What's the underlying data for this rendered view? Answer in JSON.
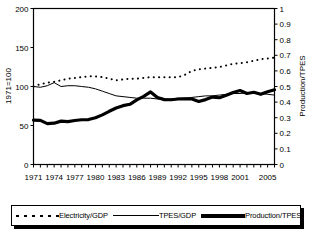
{
  "chart_data": {
    "type": "line",
    "title": "",
    "xlabel": "",
    "ylabel": "1971=100",
    "y2label": "Production/TPES",
    "grid": false,
    "legend_position": "bottom",
    "xlim": [
      1971,
      2006
    ],
    "ylim": [
      0,
      200
    ],
    "y2lim": [
      0,
      1
    ],
    "yticks": [
      0,
      50,
      100,
      150,
      200
    ],
    "ytick_labels": [
      "0",
      "50",
      "100",
      "150",
      "200"
    ],
    "y2ticks": [
      0,
      0.1,
      0.2,
      0.3,
      0.4,
      0.5,
      0.6,
      0.7,
      0.8,
      0.9,
      1
    ],
    "y2tick_labels": [
      "0",
      "0.1",
      "0.2",
      "0.3",
      "0.4",
      "0.5",
      "0.6",
      "0.7",
      "0.8",
      "0.9",
      "1"
    ],
    "xticks": [
      1971,
      1974,
      1977,
      1980,
      1983,
      1986,
      1989,
      1992,
      1995,
      1998,
      2001,
      2005
    ],
    "xtick_labels": [
      "1971",
      "1974",
      "1977",
      "1980",
      "1983",
      "1986",
      "1989",
      "1992",
      "1995",
      "1998",
      "2001",
      "2005"
    ],
    "x": [
      1971,
      1972,
      1973,
      1974,
      1975,
      1976,
      1977,
      1978,
      1979,
      1980,
      1981,
      1982,
      1983,
      1984,
      1985,
      1986,
      1987,
      1988,
      1989,
      1990,
      1991,
      1992,
      1993,
      1994,
      1995,
      1996,
      1997,
      1998,
      1999,
      2000,
      2001,
      2002,
      2003,
      2004,
      2005,
      2006
    ],
    "series": [
      {
        "name": "Electricity/GDP",
        "axis": "left",
        "style": "dotted",
        "color": "#000000",
        "values": [
          100,
          103,
          105,
          106,
          108,
          110,
          111,
          112,
          113,
          113,
          112,
          110,
          108,
          109,
          110,
          110,
          111,
          112,
          112,
          112,
          112,
          112,
          115,
          120,
          122,
          123,
          124,
          125,
          127,
          129,
          130,
          131,
          133,
          135,
          136,
          137
        ]
      },
      {
        "name": "TPES/GDP",
        "axis": "left",
        "style": "solid-thin",
        "color": "#000000",
        "values": [
          100,
          99,
          101,
          105,
          100,
          101,
          101,
          100,
          99,
          97,
          94,
          91,
          88,
          87,
          86,
          85,
          85,
          85,
          84,
          84,
          84,
          85,
          85,
          86,
          87,
          88,
          88,
          89,
          90,
          91,
          91,
          92,
          92,
          91,
          90,
          89
        ]
      },
      {
        "name": "Production/TPES",
        "axis": "right",
        "style": "solid-thick",
        "color": "#000000",
        "values": [
          0.285,
          0.283,
          0.262,
          0.265,
          0.278,
          0.275,
          0.282,
          0.287,
          0.288,
          0.3,
          0.318,
          0.341,
          0.362,
          0.377,
          0.386,
          0.414,
          0.437,
          0.465,
          0.429,
          0.416,
          0.415,
          0.42,
          0.421,
          0.42,
          0.404,
          0.416,
          0.432,
          0.428,
          0.444,
          0.462,
          0.474,
          0.455,
          0.463,
          0.45,
          0.466,
          0.479
        ]
      }
    ]
  },
  "legend": {
    "items": [
      {
        "label": "Electricity/GDP",
        "style": "dotted"
      },
      {
        "label": "TPES/GDP",
        "style": "solid-thin"
      },
      {
        "label": "Production/TPES",
        "style": "solid-thick"
      }
    ]
  }
}
